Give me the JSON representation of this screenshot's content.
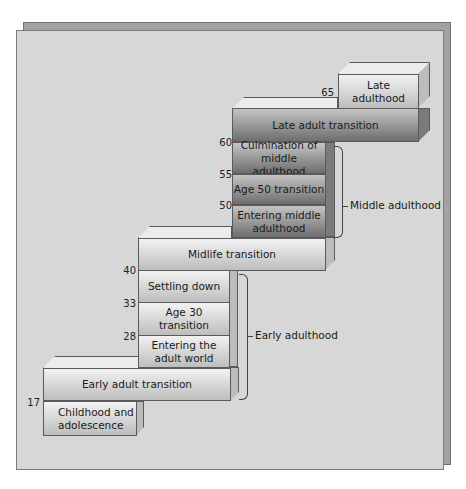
{
  "diagram": {
    "type": "staircase-timeline",
    "stages": [
      {
        "label": "Childhood and adolescence",
        "lines": [
          "Childhood and",
          "adolescence"
        ],
        "start_age": null,
        "end_age": 17,
        "kind": "era"
      },
      {
        "label": "Early adult transition",
        "start_age": 17,
        "kind": "transition"
      },
      {
        "label": "Entering the adult world",
        "lines": [
          "Entering the",
          "adult world"
        ],
        "start_age": 22,
        "end_age": 28,
        "kind": "stage"
      },
      {
        "label": "Age 30 transition",
        "start_age": 28,
        "end_age": 33,
        "kind": "transition"
      },
      {
        "label": "Settling down",
        "start_age": 33,
        "end_age": 40,
        "kind": "stage"
      },
      {
        "label": "Midlife transition",
        "start_age": 40,
        "kind": "transition"
      },
      {
        "label": "Entering middle adulthood",
        "lines": [
          "Entering middle",
          "adulthood"
        ],
        "start_age": 45,
        "end_age": 50,
        "kind": "stage"
      },
      {
        "label": "Age 50 transition",
        "start_age": 50,
        "end_age": 55,
        "kind": "transition"
      },
      {
        "label": "Culmination of middle adulthood",
        "lines": [
          "Culmination of",
          "middle adulthood"
        ],
        "start_age": 55,
        "end_age": 60,
        "kind": "stage"
      },
      {
        "label": "Late adult transition",
        "start_age": 60,
        "kind": "transition"
      },
      {
        "label": "Late adulthood",
        "start_age": 65,
        "kind": "era"
      }
    ],
    "age_markers": [
      "17",
      "28",
      "33",
      "40",
      "50",
      "55",
      "60",
      "65"
    ],
    "groups": [
      {
        "label": "Early adulthood"
      },
      {
        "label": "Middle adulthood"
      }
    ],
    "labels": {
      "childhood_l1": "Childhood and",
      "childhood_l2": "adolescence",
      "early_transition": "Early adult transition",
      "entering_adult_l1": "Entering the",
      "entering_adult_l2": "adult world",
      "age30": "Age 30 transition",
      "settling": "Settling down",
      "midlife": "Midlife transition",
      "entering_middle_l1": "Entering middle",
      "entering_middle_l2": "adulthood",
      "age50": "Age 50 transition",
      "culmination_l1": "Culmination of",
      "culmination_l2": "middle adulthood",
      "late_transition": "Late adult transition",
      "late_adulthood": "Late adulthood"
    },
    "colors": {
      "panel": "#d7d7d7",
      "panel_shadow": "#a3a3a3",
      "light_block": "#d6d6d6",
      "dark_block": "#8a8a8a"
    }
  }
}
